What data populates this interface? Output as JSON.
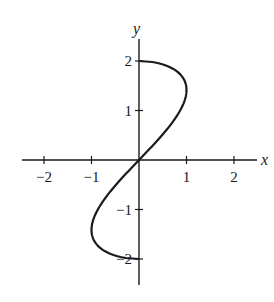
{
  "chart_data": {
    "type": "line",
    "title": "",
    "xlabel": "x",
    "ylabel": "y",
    "xlim": [
      -2.5,
      2.5
    ],
    "ylim": [
      -2.5,
      2.5
    ],
    "grid": false,
    "legend": null,
    "x_ticks": [
      -2,
      -1,
      1,
      2
    ],
    "x_tick_labels": [
      "−2",
      "−1",
      "1",
      "2"
    ],
    "y_ticks": [
      -2,
      -1,
      1,
      2
    ],
    "y_tick_labels": [
      "−2",
      "−1",
      "1",
      "2"
    ],
    "curve_description": "x = (y/2)·sqrt(4 − y²), for −2 ≤ y ≤ 2",
    "series": [
      {
        "name": "curve",
        "color": "#1a1a1a",
        "points": [
          {
            "x": 0.0,
            "y": -2.0
          },
          {
            "x": -0.43,
            "y": -1.95
          },
          {
            "x": -0.71,
            "y": -1.8
          },
          {
            "x": -0.89,
            "y": -1.6
          },
          {
            "x": -0.98,
            "y": -1.4
          },
          {
            "x": -0.98,
            "y": -1.2
          },
          {
            "x": -0.87,
            "y": -1.0
          },
          {
            "x": -0.73,
            "y": -0.8
          },
          {
            "x": -0.57,
            "y": -0.6
          },
          {
            "x": -0.39,
            "y": -0.4
          },
          {
            "x": -0.2,
            "y": -0.2
          },
          {
            "x": 0.0,
            "y": 0.0
          },
          {
            "x": 0.2,
            "y": 0.2
          },
          {
            "x": 0.39,
            "y": 0.4
          },
          {
            "x": 0.57,
            "y": 0.6
          },
          {
            "x": 0.73,
            "y": 0.8
          },
          {
            "x": 0.87,
            "y": 1.0
          },
          {
            "x": 0.98,
            "y": 1.2
          },
          {
            "x": 0.98,
            "y": 1.4
          },
          {
            "x": 0.89,
            "y": 1.6
          },
          {
            "x": 0.71,
            "y": 1.8
          },
          {
            "x": 0.43,
            "y": 1.95
          },
          {
            "x": 0.0,
            "y": 2.0
          }
        ]
      }
    ]
  }
}
